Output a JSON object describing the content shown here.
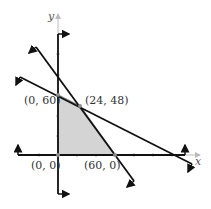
{
  "diagram": {
    "type": "linear-programming-feasible-region",
    "axes": {
      "x_label": "x",
      "y_label": "y"
    },
    "vertices": [
      {
        "label": "(0, 0)",
        "x": 0,
        "y": 0
      },
      {
        "label": "(0, 60)",
        "x": 0,
        "y": 60
      },
      {
        "label": "(24, 48)",
        "x": 24,
        "y": 48
      },
      {
        "label": "(60, 0)",
        "x": 60,
        "y": 0
      }
    ],
    "colors": {
      "region_fill": "#d4d4d4",
      "region_edge": "#8c8c8c",
      "line": "#111111",
      "axis_light": "#bbbbbb"
    }
  }
}
